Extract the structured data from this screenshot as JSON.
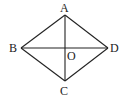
{
  "diagram": {
    "type": "rhombus-with-diagonals",
    "stroke_color": "#222222",
    "background": "#ffffff",
    "points": {
      "A": {
        "x": 65,
        "y": 15
      },
      "B": {
        "x": 21,
        "y": 48
      },
      "C": {
        "x": 65,
        "y": 81
      },
      "D": {
        "x": 108,
        "y": 48
      },
      "O": {
        "x": 65,
        "y": 48
      }
    },
    "labels": {
      "A": {
        "text": "A",
        "x": 60,
        "y": 12
      },
      "B": {
        "text": "B",
        "x": 9,
        "y": 52
      },
      "C": {
        "text": "C",
        "x": 60,
        "y": 95
      },
      "D": {
        "text": "D",
        "x": 110,
        "y": 52
      },
      "O": {
        "text": "O",
        "x": 67,
        "y": 60
      }
    },
    "segments": [
      {
        "name": "AB",
        "from": "A",
        "to": "B"
      },
      {
        "name": "BC",
        "from": "B",
        "to": "C"
      },
      {
        "name": "CD",
        "from": "C",
        "to": "D"
      },
      {
        "name": "DA",
        "from": "D",
        "to": "A"
      },
      {
        "name": "AC",
        "from": "A",
        "to": "C"
      },
      {
        "name": "BD",
        "from": "B",
        "to": "D"
      }
    ]
  }
}
